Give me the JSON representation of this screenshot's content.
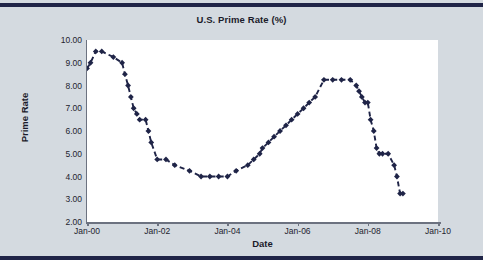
{
  "figure": {
    "background_color": "#d4dae0",
    "rule_color": "#1f2447",
    "plot_background": "#ffffff"
  },
  "chart_data": {
    "type": "line",
    "title": "U.S. Prime Rate (%)",
    "xlabel": "Date",
    "ylabel": "Prime Rate",
    "grid": false,
    "legend": "none",
    "series_color": "#1f2447",
    "marker": "diamond",
    "linestyle": "dashed",
    "xlim": [
      2000.0,
      2010.0
    ],
    "ylim": [
      2.0,
      10.0
    ],
    "xtick_labels": [
      "Jan-00",
      "Jan-02",
      "Jan-04",
      "Jan-06",
      "Jan-08",
      "Jan-10"
    ],
    "xtick_values": [
      2000.0,
      2002.0,
      2004.0,
      2006.0,
      2008.0,
      2010.0
    ],
    "ytick_labels": [
      "2.00",
      "3.00",
      "4.00",
      "5.00",
      "6.00",
      "7.00",
      "8.00",
      "9.00",
      "10.00"
    ],
    "ytick_values": [
      2.0,
      3.0,
      4.0,
      5.0,
      6.0,
      7.0,
      8.0,
      9.0,
      10.0
    ],
    "x": [
      2000.0,
      2000.1,
      2000.25,
      2000.42,
      2000.75,
      2001.0,
      2001.08,
      2001.17,
      2001.25,
      2001.33,
      2001.42,
      2001.5,
      2001.67,
      2001.75,
      2001.83,
      2002.0,
      2002.25,
      2002.5,
      2002.92,
      2003.25,
      2003.5,
      2003.75,
      2004.0,
      2004.25,
      2004.58,
      2004.75,
      2004.92,
      2005.0,
      2005.17,
      2005.33,
      2005.5,
      2005.67,
      2005.83,
      2006.0,
      2006.17,
      2006.33,
      2006.5,
      2006.75,
      2007.0,
      2007.25,
      2007.5,
      2007.67,
      2007.75,
      2007.83,
      2007.92,
      2008.0,
      2008.08,
      2008.17,
      2008.25,
      2008.33,
      2008.42,
      2008.58,
      2008.75,
      2008.83,
      2008.92,
      2009.0
    ],
    "y": [
      8.75,
      9.0,
      9.5,
      9.5,
      9.25,
      9.0,
      8.5,
      8.0,
      7.5,
      7.0,
      6.75,
      6.5,
      6.5,
      6.0,
      5.5,
      4.75,
      4.75,
      4.5,
      4.25,
      4.0,
      4.0,
      4.0,
      4.0,
      4.25,
      4.5,
      4.75,
      5.0,
      5.25,
      5.5,
      5.75,
      6.0,
      6.25,
      6.5,
      6.75,
      7.0,
      7.25,
      7.5,
      8.25,
      8.25,
      8.25,
      8.25,
      8.0,
      7.75,
      7.5,
      7.25,
      7.25,
      6.5,
      6.0,
      5.25,
      5.0,
      5.0,
      5.0,
      4.5,
      4.0,
      3.25,
      3.25
    ]
  }
}
